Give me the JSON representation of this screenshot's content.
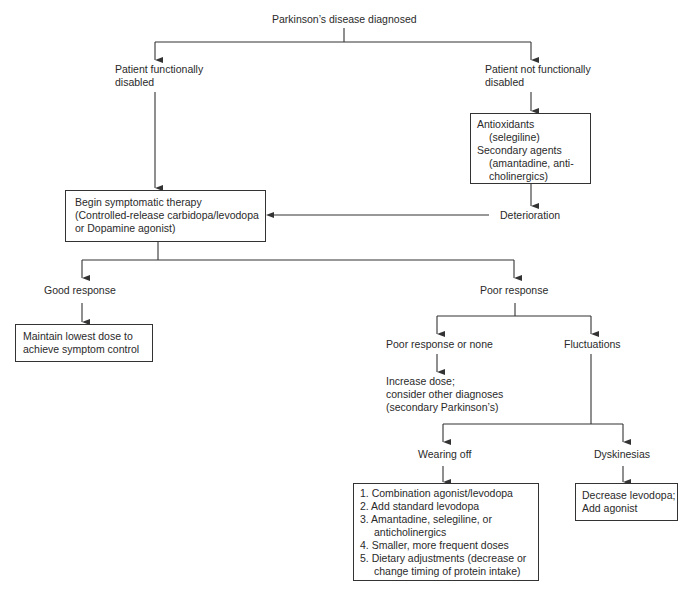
{
  "diagram": {
    "root": "Parkinson’s disease diagnosed",
    "left_branch": {
      "label_line1": "Patient functionally",
      "label_line2": "disabled"
    },
    "right_branch": {
      "label_line1": "Patient not functionally",
      "label_line2": "disabled",
      "box": {
        "line1": "Antioxidants",
        "line2": "(selegiline)",
        "line3": "Secondary agents",
        "line4": "(amantadine, anti-",
        "line5": "cholinergics)"
      },
      "deterioration": "Deterioration"
    },
    "therapy_box": {
      "line1": "Begin symptomatic therapy",
      "line2": "(Controlled-release carbidopa/levodopa",
      "line3": "or Dopamine agonist)"
    },
    "good_response": {
      "label": "Good response",
      "box_line1": "Maintain lowest dose to",
      "box_line2": "achieve symptom control"
    },
    "poor_response": {
      "label": "Poor response",
      "none": {
        "label": "Poor response or none",
        "text_line1": "Increase dose;",
        "text_line2": "consider other diagnoses",
        "text_line3": "(secondary Parkinson’s)"
      },
      "fluctuations": {
        "label": "Fluctuations",
        "wearing_off": {
          "label": "Wearing off",
          "items": [
            "1.  Combination agonist/levodopa",
            "2.  Add standard levodopa",
            "3.  Amantadine, selegiline, or",
            "anticholinergics",
            "4.  Smaller, more frequent doses",
            "5.  Dietary adjustments (decrease or",
            "change timing of protein intake)"
          ]
        },
        "dyskinesias": {
          "label": "Dyskinesias",
          "box_line1": "Decrease levodopa;",
          "box_line2": "Add agonist"
        }
      }
    }
  }
}
